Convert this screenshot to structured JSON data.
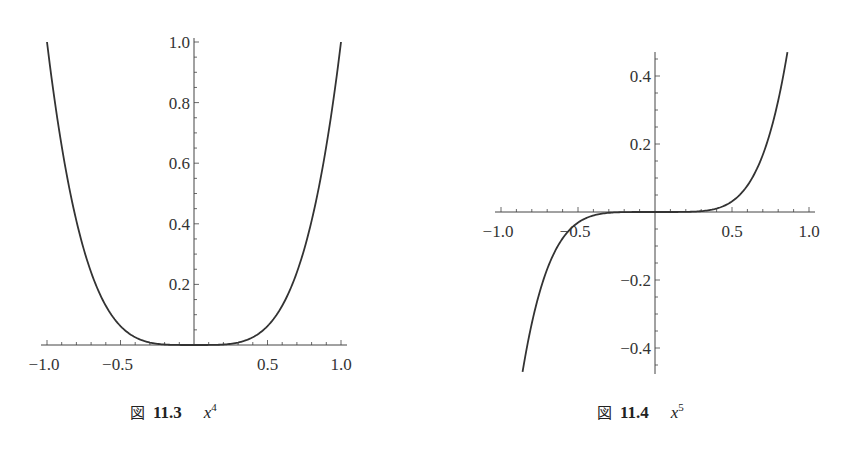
{
  "chart_data": [
    {
      "type": "line",
      "function": "x^4",
      "title": "",
      "caption": {
        "prefix": "図",
        "number": "11.3",
        "expr_base": "x",
        "expr_exp": "4"
      },
      "xlabel": "",
      "ylabel": "",
      "xlim": [
        -1.05,
        1.05
      ],
      "ylim": [
        0,
        1.0
      ],
      "grid": false,
      "legend": null,
      "x_ticks": [
        -1.0,
        -0.5,
        0.5,
        1.0
      ],
      "x_tick_labels": [
        "−1.0",
        "−0.5",
        "0.5",
        "1.0"
      ],
      "y_ticks": [
        0.2,
        0.4,
        0.6,
        0.8,
        1.0
      ],
      "y_tick_labels": [
        "0.2",
        "0.4",
        "0.6",
        "0.8",
        "1.0"
      ],
      "x": [
        -1.0,
        -0.9,
        -0.8,
        -0.7,
        -0.6,
        -0.5,
        -0.4,
        -0.3,
        -0.2,
        -0.1,
        0.0,
        0.1,
        0.2,
        0.3,
        0.4,
        0.5,
        0.6,
        0.7,
        0.8,
        0.9,
        1.0
      ],
      "y": [
        1.0,
        0.6561,
        0.4096,
        0.2401,
        0.1296,
        0.0625,
        0.0256,
        0.0081,
        0.0016,
        0.0001,
        0.0,
        0.0001,
        0.0016,
        0.0081,
        0.0256,
        0.0625,
        0.1296,
        0.2401,
        0.4096,
        0.6561,
        1.0
      ],
      "color": "#333333"
    },
    {
      "type": "line",
      "function": "x^5",
      "title": "",
      "caption": {
        "prefix": "図",
        "number": "11.4",
        "expr_base": "x",
        "expr_exp": "5"
      },
      "xlabel": "",
      "ylabel": "",
      "xlim": [
        -1.05,
        1.05
      ],
      "ylim": [
        -0.47,
        0.47
      ],
      "grid": false,
      "legend": null,
      "x_ticks": [
        -1.0,
        -0.5,
        0.5,
        1.0
      ],
      "x_tick_labels": [
        "−1.0",
        "−0.5",
        "0.5",
        "1.0"
      ],
      "y_ticks": [
        -0.4,
        -0.2,
        0.2,
        0.4
      ],
      "y_tick_labels": [
        "−0.4",
        "−0.2",
        "0.2",
        "0.4"
      ],
      "x": [
        -0.86,
        -0.8,
        -0.7,
        -0.6,
        -0.5,
        -0.4,
        -0.3,
        -0.2,
        -0.1,
        0.0,
        0.1,
        0.2,
        0.3,
        0.4,
        0.5,
        0.6,
        0.7,
        0.8,
        0.86
      ],
      "y": [
        -0.4704,
        -0.3277,
        -0.1681,
        -0.0778,
        -0.0313,
        -0.0102,
        -0.0024,
        -0.0003,
        0.0,
        0.0,
        0.0,
        0.0003,
        0.0024,
        0.0102,
        0.0313,
        0.0778,
        0.1681,
        0.3277,
        0.4704
      ],
      "color": "#333333"
    }
  ]
}
